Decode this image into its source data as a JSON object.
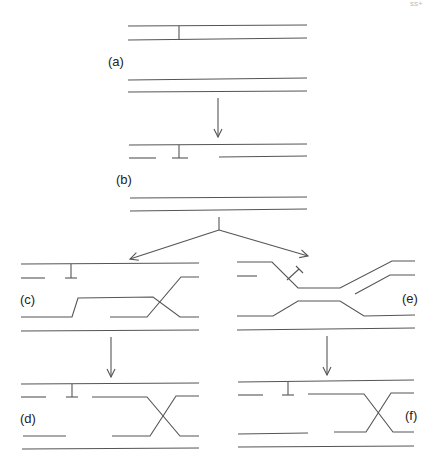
{
  "page_number": "ss+",
  "panels": {
    "a": {
      "label": "(a)"
    },
    "b": {
      "label": "(b)"
    },
    "c": {
      "label": "(c)"
    },
    "d": {
      "label": "(d)"
    },
    "e": {
      "label": "(e)"
    },
    "f": {
      "label": "(f)"
    }
  },
  "colors": {
    "line": "#555555",
    "text": "#222222"
  }
}
